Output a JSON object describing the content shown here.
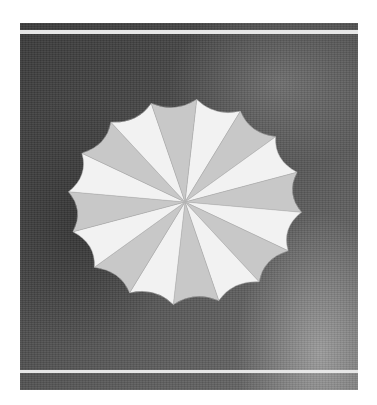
{
  "image": {
    "subject": "folded paper rosette",
    "background": "dark textured surface",
    "points": 16,
    "colors": {
      "paper": "#f2f2f2",
      "paper_shadow": "#c8c8c8",
      "background_dark": "#3a3a3a",
      "background_light": "#6a6a6a",
      "stripe": "#e6e6e6"
    }
  }
}
